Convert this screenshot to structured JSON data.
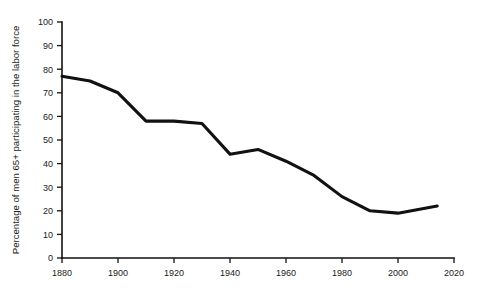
{
  "chart_data": {
    "type": "line",
    "title": "",
    "subtitle": "",
    "xlabel": "",
    "ylabel": "Percentage of men 65+ participating in the labor force",
    "xlim": [
      1880,
      2020
    ],
    "ylim": [
      0,
      100
    ],
    "grid": false,
    "legend": "none",
    "x_ticks": [
      1880,
      1900,
      1920,
      1940,
      1960,
      1980,
      2000,
      2020
    ],
    "x_tick_labels": [
      "1880",
      "1900",
      "1920",
      "1940",
      "1960",
      "1980",
      "2000",
      "2020"
    ],
    "y_ticks": [
      0,
      10,
      20,
      30,
      40,
      50,
      60,
      70,
      80,
      90,
      100
    ],
    "y_tick_labels": [
      "0",
      "10",
      "20",
      "30",
      "40",
      "50",
      "60",
      "70",
      "80",
      "90",
      "100"
    ],
    "series": [
      {
        "name": "Men 65+ labor force participation",
        "color": "#111111",
        "x": [
          1880,
          1890,
          1900,
          1910,
          1920,
          1930,
          1940,
          1950,
          1960,
          1970,
          1980,
          1990,
          2000,
          2014
        ],
        "values": [
          77,
          75,
          70,
          58,
          58,
          57,
          44,
          46,
          41,
          35,
          26,
          20,
          19,
          22
        ]
      }
    ]
  }
}
